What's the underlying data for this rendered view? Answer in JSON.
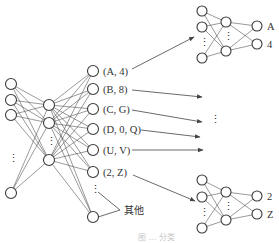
{
  "diagram": {
    "type": "neural-network-pipeline",
    "main_network": {
      "input_nodes": 4,
      "hidden_nodes": 3,
      "output_nodes": 7,
      "output_labels": [
        "(A, 4)",
        "(B, 8)",
        "(C, G)",
        "(D, 0, Q)",
        "(U, V)",
        "(2, Z)"
      ],
      "other_label": "其他"
    },
    "sub_networks": [
      {
        "id": "top",
        "output_labels": [
          "A",
          "4"
        ]
      },
      {
        "id": "bottom",
        "output_labels": [
          "2",
          "Z"
        ]
      }
    ],
    "ellipsis": "⋮",
    "caption": "图 ... 分类"
  }
}
